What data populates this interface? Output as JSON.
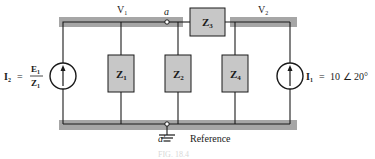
{
  "diagram": {
    "type": "circuit",
    "colors": {
      "bus": "#a6a6a6",
      "box_fill": "#c7c7c7",
      "wire": "#1a1a1a",
      "background": "#ffffff"
    },
    "nodes": {
      "v1_label": "V",
      "v1_sub": "1",
      "v2_label": "V",
      "v2_sub": "2",
      "a_label": "a",
      "a_prime_label": "a′",
      "reference_label": "Reference"
    },
    "impedances": [
      {
        "id": "Z1",
        "label": "Z",
        "sub": "1"
      },
      {
        "id": "Z2",
        "label": "Z",
        "sub": "2"
      },
      {
        "id": "Z3",
        "label": "Z",
        "sub": "3"
      },
      {
        "id": "Z4",
        "label": "Z",
        "sub": "4"
      }
    ],
    "sources": {
      "left": {
        "label": "I",
        "sub": "2",
        "eq": "=",
        "num": "E",
        "num_sub": "1",
        "den": "Z",
        "den_sub": "1"
      },
      "right": {
        "label": "I",
        "sub": "1",
        "eq": "=",
        "value": "10 ∠ 20°"
      }
    },
    "caption": "FIG. 18.4"
  }
}
